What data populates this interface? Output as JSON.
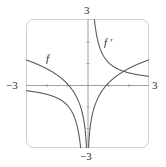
{
  "chart_data": {
    "type": "line",
    "title": "",
    "xlabel": "",
    "ylabel": "",
    "xlim": [
      -3,
      3
    ],
    "ylim": [
      -3,
      3
    ],
    "grid": false,
    "tick_labels": {
      "x_min": "−3",
      "x_max": "3",
      "y_min": "−3",
      "y_max": "3"
    },
    "x_ticks": [
      -2,
      -1,
      1,
      2
    ],
    "y_ticks": [
      -2,
      -1,
      1,
      2
    ],
    "series": [
      {
        "name": "f",
        "label": "f",
        "expression": "ln|x|",
        "points": [
          [
            -3,
            1.1
          ],
          [
            -2,
            0.69
          ],
          [
            -1,
            0
          ],
          [
            -0.5,
            -0.69
          ],
          [
            -0.1,
            -2.3
          ],
          [
            -0.05,
            -3.0
          ],
          [
            0.05,
            -3.0
          ],
          [
            0.1,
            -2.3
          ],
          [
            0.5,
            -0.69
          ],
          [
            1,
            0
          ],
          [
            2,
            0.69
          ],
          [
            3,
            1.1
          ]
        ]
      },
      {
        "name": "f'",
        "label": "f ′",
        "expression": "1/x",
        "points": [
          [
            -3,
            -0.33
          ],
          [
            -2,
            -0.5
          ],
          [
            -1,
            -1
          ],
          [
            -0.5,
            -2
          ],
          [
            -0.33,
            -3.0
          ],
          [
            0.33,
            3.0
          ],
          [
            0.5,
            2
          ],
          [
            1,
            1
          ],
          [
            2,
            0.5
          ],
          [
            3,
            0.33
          ]
        ]
      }
    ],
    "annotations": [
      {
        "text": "f",
        "near": [
          -2,
          1.2
        ]
      },
      {
        "text": "f ′",
        "near": [
          1.2,
          2.1
        ]
      }
    ],
    "line_color": "#555555",
    "frame_color": "#c8c8c8",
    "axis_color": "#9a9a9a"
  }
}
